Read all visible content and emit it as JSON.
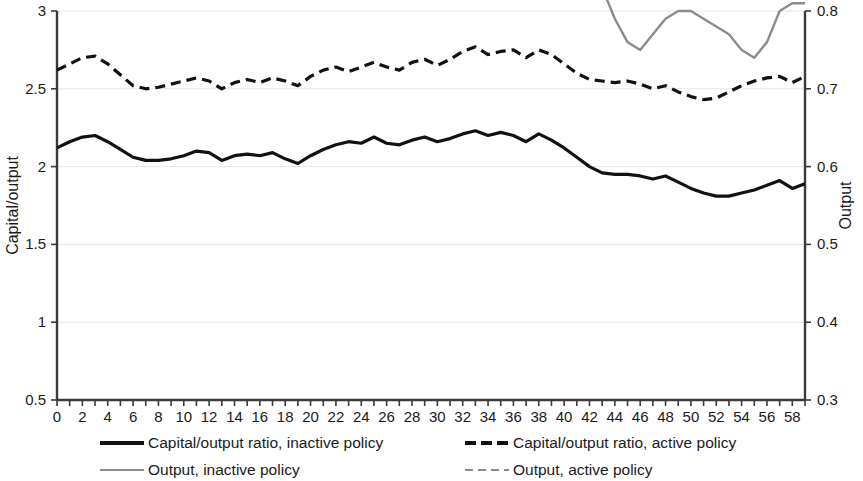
{
  "chart_data": {
    "type": "line",
    "title": "",
    "xlabel": "",
    "ylabel": "Capital/output",
    "y2label": "Output",
    "xlim": [
      0,
      59
    ],
    "ylim": [
      0.5,
      3
    ],
    "y2lim": [
      0.3,
      0.8
    ],
    "ytick_labels": [
      "0.5",
      "1",
      "1.5",
      "2",
      "2.5",
      "3"
    ],
    "ytick_values": [
      0.5,
      1,
      1.5,
      2,
      2.5,
      3
    ],
    "y2tick_labels": [
      "0.3",
      "0.4",
      "0.5",
      "0.6",
      "0.7",
      "0.8"
    ],
    "y2tick_values": [
      0.3,
      0.4,
      0.5,
      0.6,
      0.7,
      0.8
    ],
    "xtick_labels": [
      "0",
      "2",
      "4",
      "6",
      "8",
      "10",
      "12",
      "14",
      "16",
      "18",
      "20",
      "22",
      "24",
      "26",
      "28",
      "30",
      "32",
      "34",
      "36",
      "38",
      "40",
      "42",
      "44",
      "46",
      "48",
      "50",
      "52",
      "54",
      "56",
      "58"
    ],
    "xtick_values": [
      0,
      2,
      4,
      6,
      8,
      10,
      12,
      14,
      16,
      18,
      20,
      22,
      24,
      26,
      28,
      30,
      32,
      34,
      36,
      38,
      40,
      42,
      44,
      46,
      48,
      50,
      52,
      54,
      56,
      58
    ],
    "xtick_minor_step": 1,
    "grid": "horizontal",
    "legend_position": "bottom",
    "x": [
      0,
      1,
      2,
      3,
      4,
      5,
      6,
      7,
      8,
      9,
      10,
      11,
      12,
      13,
      14,
      15,
      16,
      17,
      18,
      19,
      20,
      21,
      22,
      23,
      24,
      25,
      26,
      27,
      28,
      29,
      30,
      31,
      32,
      33,
      34,
      35,
      36,
      37,
      38,
      39,
      40,
      41,
      42,
      43,
      44,
      45,
      46,
      47,
      48,
      49,
      50,
      51,
      52,
      53,
      54,
      55,
      56,
      57,
      58,
      59
    ],
    "series": [
      {
        "name": "Capital/output ratio, inactive policy",
        "axis": "left",
        "style": "solid",
        "color": "#111111",
        "width": 3.2,
        "values": [
          2.12,
          2.16,
          2.19,
          2.2,
          2.16,
          2.11,
          2.06,
          2.04,
          2.04,
          2.05,
          2.07,
          2.1,
          2.09,
          2.04,
          2.07,
          2.08,
          2.07,
          2.09,
          2.05,
          2.02,
          2.07,
          2.11,
          2.14,
          2.16,
          2.15,
          2.19,
          2.15,
          2.14,
          2.17,
          2.19,
          2.16,
          2.18,
          2.21,
          2.23,
          2.2,
          2.22,
          2.2,
          2.16,
          2.21,
          2.17,
          2.12,
          2.06,
          2.0,
          1.96,
          1.95,
          1.95,
          1.94,
          1.92,
          1.94,
          1.9,
          1.86,
          1.83,
          1.81,
          1.81,
          1.83,
          1.85,
          1.88,
          1.91,
          1.86,
          1.89
        ]
      },
      {
        "name": "Capital/output ratio, active policy",
        "axis": "left",
        "style": "dashed",
        "color": "#111111",
        "width": 3.2,
        "values": [
          2.62,
          2.66,
          2.7,
          2.71,
          2.66,
          2.59,
          2.52,
          2.5,
          2.51,
          2.53,
          2.55,
          2.57,
          2.55,
          2.5,
          2.54,
          2.56,
          2.54,
          2.57,
          2.55,
          2.52,
          2.58,
          2.62,
          2.64,
          2.61,
          2.64,
          2.67,
          2.64,
          2.62,
          2.67,
          2.69,
          2.65,
          2.69,
          2.74,
          2.77,
          2.72,
          2.74,
          2.75,
          2.7,
          2.75,
          2.72,
          2.66,
          2.6,
          2.56,
          2.55,
          2.54,
          2.55,
          2.53,
          2.5,
          2.52,
          2.48,
          2.45,
          2.43,
          2.44,
          2.48,
          2.52,
          2.55,
          2.57,
          2.58,
          2.54,
          2.58
        ]
      },
      {
        "name": "Output, inactive policy",
        "axis": "right",
        "style": "solid",
        "color": "#8c8c8c",
        "width": 2.4,
        "values": [
          0.97,
          0.93,
          0.9,
          0.89,
          0.91,
          0.95,
          1.0,
          1.04,
          1.06,
          1.07,
          1.07,
          1.07,
          1.08,
          1.13,
          1.14,
          1.15,
          1.19,
          1.22,
          1.2,
          1.18,
          1.22,
          1.26,
          1.29,
          1.3,
          1.28,
          1.29,
          1.28,
          1.27,
          1.28,
          1.26,
          1.24,
          1.25,
          1.22,
          1.18,
          1.18,
          1.13,
          1.09,
          1.05,
          1.01,
          0.95,
          0.95,
          0.9,
          0.86,
          0.83,
          0.79,
          0.76,
          0.75,
          0.77,
          0.79,
          0.8,
          0.8,
          0.79,
          0.78,
          0.77,
          0.75,
          0.74,
          0.76,
          0.8,
          0.81,
          0.81
        ]
      },
      {
        "name": "Output, active policy",
        "axis": "right",
        "style": "dashed",
        "color": "#8c8c8c",
        "width": 2.4,
        "values": [
          1.37,
          1.33,
          1.3,
          1.28,
          1.31,
          1.36,
          1.41,
          1.44,
          1.43,
          1.42,
          1.44,
          1.46,
          1.45,
          1.51,
          1.53,
          1.51,
          1.55,
          1.6,
          1.57,
          1.54,
          1.58,
          1.61,
          1.63,
          1.65,
          1.62,
          1.64,
          1.63,
          1.62,
          1.63,
          1.6,
          1.58,
          1.6,
          1.56,
          1.51,
          1.5,
          1.45,
          1.42,
          1.39,
          1.36,
          1.32,
          1.31,
          1.27,
          1.23,
          1.21,
          1.24,
          1.27,
          1.29,
          1.29,
          1.28,
          1.27,
          1.29,
          1.33,
          1.36,
          1.38,
          1.38,
          1.36,
          1.34,
          1.37,
          1.41,
          1.42
        ]
      }
    ]
  },
  "legend": {
    "entries": [
      {
        "label": "Capital/output ratio, inactive policy",
        "style": "solid",
        "color": "#111111",
        "width": 4
      },
      {
        "label": "Capital/output ratio, active policy",
        "style": "dashed",
        "color": "#111111",
        "width": 4
      },
      {
        "label": "Output, inactive policy",
        "style": "solid",
        "color": "#8c8c8c",
        "width": 2
      },
      {
        "label": "Output, active policy",
        "style": "dashed",
        "color": "#8c8c8c",
        "width": 2
      }
    ]
  }
}
